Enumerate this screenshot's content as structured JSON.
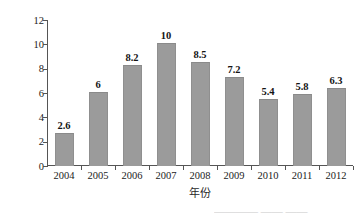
{
  "chart_data": {
    "type": "bar",
    "title": "",
    "subtitle": "",
    "xlabel": "年份",
    "ylabel": "产量（万吨）",
    "categories": [
      "2004",
      "2005",
      "2006",
      "2007",
      "2008",
      "2009",
      "2010",
      "2011",
      "2012"
    ],
    "values": [
      2.6,
      6,
      8.2,
      10,
      8.5,
      7.2,
      5.4,
      5.8,
      6.3
    ],
    "value_labels": [
      "2.6",
      "6",
      "8.2",
      "10",
      "8.5",
      "7.2",
      "5.4",
      "5.8",
      "6.3"
    ],
    "ylim": [
      0,
      12
    ],
    "y_ticks": [
      0,
      2,
      4,
      6,
      8,
      10,
      12
    ],
    "y_tick_labels": [
      "0",
      "2",
      "4",
      "6",
      "8",
      "10",
      "12"
    ],
    "grid": false,
    "legend": null,
    "bar_color": "#9b9b9b",
    "axis_color": "#555555"
  },
  "axes": {
    "y_title": "产量（万吨）",
    "x_title": "年份"
  },
  "caption": {
    "bottom_cut_text": "————  ——  ——"
  }
}
